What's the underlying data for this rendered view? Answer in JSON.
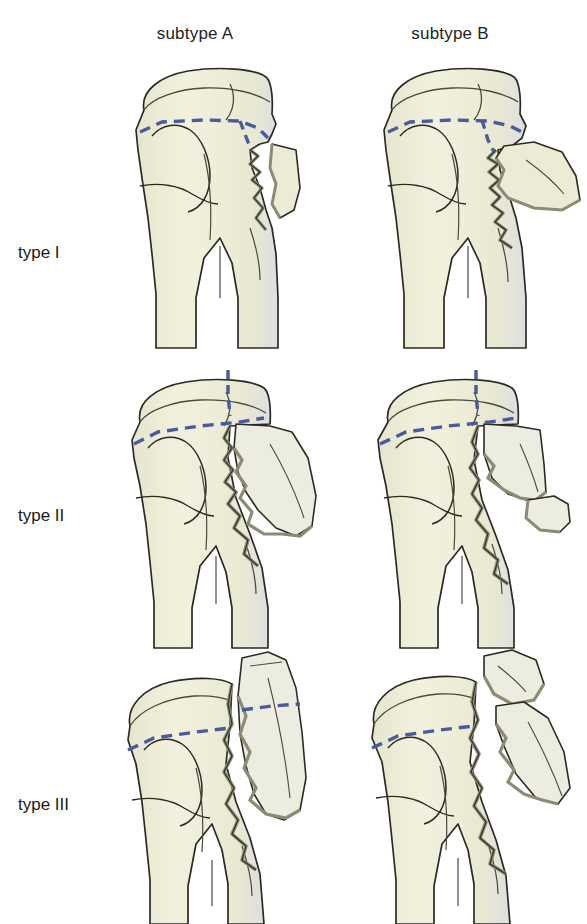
{
  "figure": {
    "background_color": "#ffffff"
  },
  "columns": [
    {
      "id": "subtype-a",
      "label": "subtype A"
    },
    {
      "id": "subtype-b",
      "label": "subtype B"
    }
  ],
  "rows": [
    {
      "id": "type-1",
      "label": "type  I"
    },
    {
      "id": "type-2",
      "label": "type  II"
    },
    {
      "id": "type-3",
      "label": "type  III"
    }
  ],
  "palette": {
    "bone_fill": "#eeeedb",
    "bone_fill_shadow": "#e3e3c8",
    "bone_outline": "#2b2b24",
    "fracture_edge": "#8c8c74",
    "fracture_edge_dark": "#6e6e58",
    "contour_line": "#4a4a3c",
    "reference_line": "#4a5a9a",
    "background": "#ffffff"
  },
  "panels": [
    {
      "id": "type-1-subtype-a",
      "row": "type  I",
      "column": "subtype A",
      "fragment_count": 1,
      "fragment_description": "Small lateral wedge fragment, minimally displaced; dashed reference line dips down to meet the fracture line.",
      "reference_line": "articular-plane-dashed",
      "reference_line_has_vertical_limb": true
    },
    {
      "id": "type-1-subtype-b",
      "row": "type  I",
      "column": "subtype B",
      "fragment_count": 1,
      "fragment_description": "Larger lateral wedge fragment displaced outward with long jagged fracture margin running down the shaft.",
      "reference_line": "articular-plane-dashed",
      "reference_line_has_vertical_limb": true
    },
    {
      "id": "type-2-subtype-a",
      "row": "type  II",
      "column": "subtype A",
      "fragment_count": 1,
      "fragment_description": "Long tapering lateral fragment split off from the metaphysis, serrated inner border, dashed line with vertical limb at the head.",
      "reference_line": "articular-plane-dashed",
      "reference_line_has_vertical_limb": true
    },
    {
      "id": "type-2-subtype-b",
      "row": "type  II",
      "column": "subtype B",
      "fragment_count": 2,
      "fragment_description": "Upper quadrilateral fragment plus a smaller detached distal fragment lying lateral to the shaft.",
      "reference_line": "articular-plane-dashed",
      "reference_line_has_vertical_limb": true
    },
    {
      "id": "type-3-subtype-a",
      "row": "type  III",
      "column": "subtype A",
      "fragment_count": 1,
      "fragment_description": "Full-height lateral fragment including part of the articular surface; the dashed reference line continues across the fragment.",
      "reference_line": "articular-plane-dashed",
      "reference_line_has_vertical_limb": false,
      "fragment_carries_reference_line": true
    },
    {
      "id": "type-3-subtype-b",
      "row": "type  III",
      "column": "subtype B",
      "fragment_count": 2,
      "fragment_description": "Articular head fragment separated above and a long lateral shaft fragment below, both widely displaced.",
      "reference_line": "articular-plane-dashed",
      "reference_line_has_vertical_limb": false
    }
  ]
}
